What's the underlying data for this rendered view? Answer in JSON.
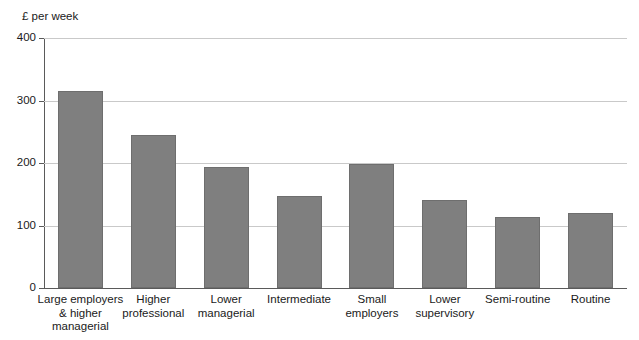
{
  "chart_data": {
    "type": "bar",
    "title": "",
    "xlabel": "",
    "ylabel": "£ per week",
    "ylim": [
      0,
      400
    ],
    "yticks": [
      0,
      100,
      200,
      300,
      400
    ],
    "ytick_labels": [
      "0",
      "100",
      "200",
      "300",
      "400"
    ],
    "grid": true,
    "legend": null,
    "legend_position": "none",
    "bar_color": "#7f7f7f",
    "categories": [
      "Large employers\n& higher\nmanagerial",
      "Higher\nprofessional",
      "Lower\nmanagerial",
      "Intermediate",
      "Small\nemployers",
      "Lower\nsupervisory",
      "Semi-routine",
      "Routine"
    ],
    "values": [
      315,
      245,
      193,
      147,
      198,
      141,
      114,
      120
    ]
  },
  "axis": {
    "y_title": "£ per week"
  }
}
